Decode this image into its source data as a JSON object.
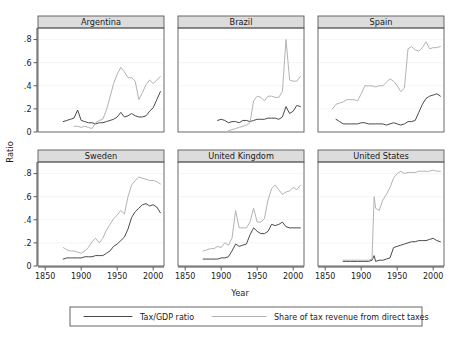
{
  "figure": {
    "ylabel": "Ratio",
    "xlabel": "Year"
  },
  "legend": {
    "items": [
      {
        "label": "Tax/GDP ratio",
        "color": "#4a4a4a",
        "style": "solid-dark"
      },
      {
        "label": "Share of tax revenue from direct taxes",
        "color": "#b3b3b3",
        "style": "solid-light"
      }
    ]
  },
  "axes": {
    "y_ticks": [
      "0",
      ".2",
      ".4",
      ".6",
      ".8"
    ],
    "y_values": [
      0,
      0.2,
      0.4,
      0.6,
      0.8
    ],
    "x_ticks": [
      "1850",
      "1900",
      "1950",
      "2000"
    ],
    "x_values": [
      1850,
      1900,
      1950,
      2000
    ],
    "xlim": [
      1840,
      2015
    ],
    "ylim": [
      0,
      0.9
    ]
  },
  "chart_data": {
    "type": "line",
    "title": "",
    "xlabel": "Year",
    "ylabel": "Ratio",
    "xlim": [
      1840,
      2015
    ],
    "ylim": [
      0,
      0.9
    ],
    "grid": true,
    "legend_position": "bottom",
    "panels": [
      {
        "name": "Argentina",
        "series": [
          {
            "name": "Tax/GDP ratio",
            "color": "#4a4a4a",
            "x": [
              1875,
              1880,
              1885,
              1890,
              1895,
              1900,
              1905,
              1910,
              1915,
              1920,
              1925,
              1930,
              1935,
              1940,
              1945,
              1950,
              1955,
              1960,
              1965,
              1970,
              1975,
              1980,
              1985,
              1990,
              1995,
              2000,
              2005,
              2010
            ],
            "y": [
              0.09,
              0.1,
              0.11,
              0.12,
              0.19,
              0.1,
              0.09,
              0.08,
              0.08,
              0.07,
              0.08,
              0.08,
              0.09,
              0.1,
              0.11,
              0.13,
              0.17,
              0.13,
              0.14,
              0.16,
              0.14,
              0.13,
              0.13,
              0.14,
              0.18,
              0.21,
              0.28,
              0.35
            ]
          },
          {
            "name": "Share of tax revenue from direct taxes",
            "color": "#b3b3b3",
            "x": [
              1890,
              1895,
              1900,
              1905,
              1910,
              1915,
              1920,
              1925,
              1930,
              1935,
              1940,
              1945,
              1950,
              1955,
              1960,
              1965,
              1970,
              1975,
              1980,
              1985,
              1990,
              1995,
              2000,
              2005,
              2010
            ],
            "y": [
              0.05,
              0.05,
              0.04,
              0.05,
              0.04,
              0.03,
              0.08,
              0.1,
              0.11,
              0.19,
              0.3,
              0.42,
              0.5,
              0.56,
              0.52,
              0.47,
              0.47,
              0.44,
              0.28,
              0.34,
              0.41,
              0.45,
              0.42,
              0.45,
              0.48
            ]
          }
        ]
      },
      {
        "name": "Brazil",
        "series": [
          {
            "name": "Tax/GDP ratio",
            "color": "#4a4a4a",
            "x": [
              1895,
              1900,
              1905,
              1910,
              1915,
              1920,
              1925,
              1930,
              1935,
              1940,
              1945,
              1950,
              1955,
              1960,
              1965,
              1970,
              1975,
              1980,
              1985,
              1990,
              1995,
              2000,
              2005,
              2010
            ],
            "y": [
              0.1,
              0.11,
              0.1,
              0.08,
              0.09,
              0.09,
              0.08,
              0.1,
              0.1,
              0.09,
              0.1,
              0.11,
              0.11,
              0.11,
              0.12,
              0.12,
              0.12,
              0.11,
              0.13,
              0.22,
              0.16,
              0.18,
              0.23,
              0.22
            ]
          },
          {
            "name": "Share of tax revenue from direct taxes",
            "color": "#b3b3b3",
            "x": [
              1910,
              1915,
              1920,
              1925,
              1930,
              1935,
              1940,
              1945,
              1950,
              1955,
              1960,
              1965,
              1970,
              1975,
              1980,
              1985,
              1990,
              1995,
              2000,
              2005,
              2010
            ],
            "y": [
              0.01,
              0.02,
              0.03,
              0.04,
              0.05,
              0.06,
              0.08,
              0.27,
              0.31,
              0.3,
              0.27,
              0.31,
              0.31,
              0.3,
              0.3,
              0.35,
              0.8,
              0.45,
              0.44,
              0.44,
              0.48
            ]
          }
        ]
      },
      {
        "name": "Spain",
        "series": [
          {
            "name": "Tax/GDP ratio",
            "color": "#4a4a4a",
            "x": [
              1865,
              1870,
              1875,
              1880,
              1885,
              1890,
              1895,
              1900,
              1905,
              1910,
              1915,
              1920,
              1925,
              1930,
              1935,
              1940,
              1945,
              1950,
              1955,
              1960,
              1965,
              1970,
              1975,
              1980,
              1985,
              1990,
              1995,
              2000,
              2005,
              2010
            ],
            "y": [
              0.11,
              0.09,
              0.07,
              0.07,
              0.07,
              0.07,
              0.07,
              0.08,
              0.08,
              0.07,
              0.07,
              0.07,
              0.07,
              0.07,
              0.06,
              0.07,
              0.08,
              0.07,
              0.06,
              0.07,
              0.09,
              0.09,
              0.1,
              0.17,
              0.24,
              0.29,
              0.31,
              0.32,
              0.33,
              0.31
            ]
          },
          {
            "name": "Share of tax revenue from direct taxes",
            "color": "#b3b3b3",
            "x": [
              1860,
              1865,
              1870,
              1875,
              1880,
              1885,
              1890,
              1895,
              1900,
              1905,
              1910,
              1915,
              1920,
              1925,
              1930,
              1935,
              1940,
              1945,
              1950,
              1955,
              1960,
              1965,
              1970,
              1975,
              1980,
              1985,
              1990,
              1995,
              2000,
              2005,
              2010
            ],
            "y": [
              0.2,
              0.24,
              0.25,
              0.26,
              0.28,
              0.28,
              0.28,
              0.27,
              0.33,
              0.4,
              0.4,
              0.4,
              0.39,
              0.4,
              0.4,
              0.43,
              0.46,
              0.44,
              0.4,
              0.35,
              0.38,
              0.72,
              0.74,
              0.71,
              0.7,
              0.73,
              0.78,
              0.72,
              0.73,
              0.73,
              0.74
            ]
          }
        ]
      },
      {
        "name": "Sweden",
        "series": [
          {
            "name": "Tax/GDP ratio",
            "color": "#4a4a4a",
            "x": [
              1875,
              1880,
              1885,
              1890,
              1895,
              1900,
              1905,
              1910,
              1915,
              1920,
              1925,
              1930,
              1935,
              1940,
              1945,
              1950,
              1955,
              1960,
              1965,
              1970,
              1975,
              1980,
              1985,
              1990,
              1995,
              2000,
              2005,
              2010
            ],
            "y": [
              0.06,
              0.07,
              0.07,
              0.07,
              0.07,
              0.07,
              0.08,
              0.08,
              0.08,
              0.09,
              0.09,
              0.09,
              0.11,
              0.13,
              0.17,
              0.19,
              0.22,
              0.25,
              0.32,
              0.42,
              0.47,
              0.5,
              0.53,
              0.54,
              0.52,
              0.53,
              0.51,
              0.46
            ]
          },
          {
            "name": "Share of tax revenue from direct taxes",
            "color": "#b3b3b3",
            "x": [
              1875,
              1880,
              1885,
              1890,
              1895,
              1900,
              1905,
              1910,
              1915,
              1920,
              1925,
              1930,
              1935,
              1940,
              1945,
              1950,
              1955,
              1960,
              1965,
              1970,
              1975,
              1980,
              1985,
              1990,
              1995,
              2000,
              2005,
              2010
            ],
            "y": [
              0.16,
              0.14,
              0.13,
              0.13,
              0.12,
              0.11,
              0.13,
              0.16,
              0.21,
              0.24,
              0.2,
              0.24,
              0.31,
              0.36,
              0.41,
              0.44,
              0.48,
              0.45,
              0.6,
              0.7,
              0.74,
              0.77,
              0.76,
              0.75,
              0.74,
              0.74,
              0.73,
              0.71
            ]
          }
        ]
      },
      {
        "name": "United Kingdom",
        "series": [
          {
            "name": "Tax/GDP ratio",
            "color": "#4a4a4a",
            "x": [
              1875,
              1880,
              1885,
              1890,
              1895,
              1900,
              1905,
              1910,
              1915,
              1920,
              1925,
              1930,
              1935,
              1940,
              1945,
              1950,
              1955,
              1960,
              1965,
              1970,
              1975,
              1980,
              1985,
              1990,
              1995,
              2000,
              2005,
              2010
            ],
            "y": [
              0.06,
              0.06,
              0.06,
              0.06,
              0.06,
              0.07,
              0.07,
              0.08,
              0.13,
              0.19,
              0.17,
              0.18,
              0.19,
              0.27,
              0.33,
              0.3,
              0.28,
              0.28,
              0.3,
              0.36,
              0.35,
              0.36,
              0.38,
              0.34,
              0.33,
              0.33,
              0.33,
              0.33
            ]
          },
          {
            "name": "Share of tax revenue from direct taxes",
            "color": "#b3b3b3",
            "x": [
              1875,
              1880,
              1885,
              1890,
              1895,
              1900,
              1905,
              1910,
              1915,
              1920,
              1925,
              1930,
              1935,
              1940,
              1945,
              1950,
              1955,
              1960,
              1965,
              1970,
              1975,
              1980,
              1985,
              1990,
              1995,
              2000,
              2005,
              2010
            ],
            "y": [
              0.13,
              0.14,
              0.15,
              0.15,
              0.17,
              0.16,
              0.2,
              0.18,
              0.24,
              0.48,
              0.33,
              0.33,
              0.33,
              0.38,
              0.5,
              0.38,
              0.38,
              0.41,
              0.57,
              0.67,
              0.7,
              0.66,
              0.62,
              0.64,
              0.65,
              0.68,
              0.66,
              0.7
            ]
          }
        ]
      },
      {
        "name": "United States",
        "series": [
          {
            "name": "Tax/GDP ratio",
            "color": "#4a4a4a",
            "x": [
              1875,
              1880,
              1885,
              1890,
              1895,
              1900,
              1905,
              1910,
              1915,
              1918,
              1920,
              1925,
              1930,
              1935,
              1940,
              1945,
              1950,
              1955,
              1960,
              1965,
              1970,
              1975,
              1980,
              1985,
              1990,
              1995,
              2000,
              2005,
              2010
            ],
            "y": [
              0.04,
              0.04,
              0.04,
              0.04,
              0.04,
              0.04,
              0.04,
              0.04,
              0.05,
              0.09,
              0.04,
              0.05,
              0.05,
              0.06,
              0.07,
              0.16,
              0.17,
              0.18,
              0.19,
              0.2,
              0.21,
              0.21,
              0.22,
              0.22,
              0.22,
              0.23,
              0.24,
              0.22,
              0.21
            ]
          },
          {
            "name": "Share of tax revenue from direct taxes",
            "color": "#b3b3b3",
            "x": [
              1875,
              1880,
              1885,
              1890,
              1895,
              1900,
              1905,
              1910,
              1915,
              1918,
              1920,
              1925,
              1930,
              1935,
              1940,
              1945,
              1950,
              1955,
              1960,
              1965,
              1970,
              1975,
              1980,
              1985,
              1990,
              1995,
              2000,
              2005,
              2010
            ],
            "y": [
              0.05,
              0.05,
              0.05,
              0.05,
              0.05,
              0.05,
              0.05,
              0.05,
              0.06,
              0.6,
              0.5,
              0.48,
              0.57,
              0.62,
              0.68,
              0.76,
              0.8,
              0.82,
              0.8,
              0.81,
              0.81,
              0.81,
              0.82,
              0.82,
              0.82,
              0.82,
              0.83,
              0.82,
              0.82
            ]
          }
        ]
      }
    ]
  }
}
